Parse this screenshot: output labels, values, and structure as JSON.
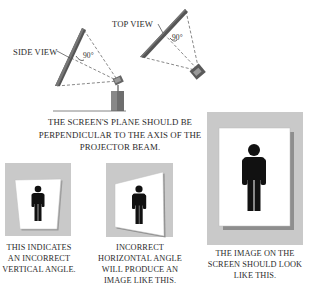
{
  "diagram": {
    "top_section": {
      "side_view_label": "SIDE VIEW",
      "top_view_label": "TOP VIEW",
      "side_angle_label": "90°",
      "top_angle_label": "90°",
      "caption": "THE SCREEN'S PLANE SHOULD BE PERPENDICULAR TO THE AXIS OF THE PROJECTOR BEAM."
    },
    "panels": [
      {
        "id": "vertical",
        "caption": "THIS INDICATES AN INCORRECT VERTICAL ANGLE.",
        "shape": "keystone-trapezoid"
      },
      {
        "id": "horizontal",
        "caption": "INCORRECT HORIZONTAL ANGLE WILL PRODUCE AN IMAGE LIKE THIS.",
        "shape": "skewed-quadrilateral"
      },
      {
        "id": "correct",
        "caption": "THE IMAGE ON THE SCREEN SHOULD LOOK LIKE THIS.",
        "shape": "rectangle"
      }
    ],
    "colors": {
      "panel_gray": "#c9c9c9",
      "screen_dark": "#4a4a4a",
      "figure_black": "#111111",
      "dashed_line": "#6a6a6a"
    }
  }
}
